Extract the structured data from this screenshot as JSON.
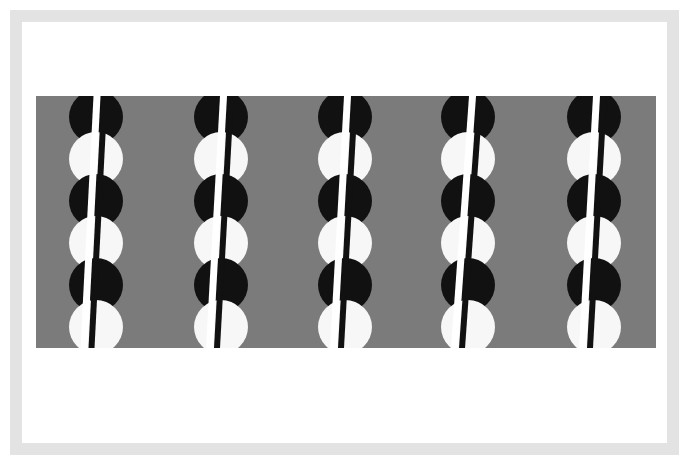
{
  "artwork": {
    "title": "Untitled geometric composition",
    "medium": "flat-color print",
    "canvas": {
      "width": 689,
      "height": 465,
      "background": "#ffffff"
    },
    "frame": {
      "band_color": "#e3e3e3",
      "outer_margin": 10,
      "band_thickness": 12,
      "inner_margin": 22
    },
    "field": {
      "name": "gray-field",
      "color": "#7b7b7b",
      "x": 36,
      "y": 96,
      "width": 620,
      "height": 252
    },
    "discs": {
      "diameter": 54,
      "rows": 6,
      "row_step": 42,
      "row_start_y": 96,
      "colors": [
        "#111111",
        "#f7f7f7"
      ],
      "black_color": "#111111",
      "white_color": "#f7f7f7"
    },
    "columns": [
      {
        "name": "column-1",
        "center_x": 96,
        "rule_top_x": 101,
        "rule_bottom_x": 88
      },
      {
        "name": "column-2",
        "center_x": 221,
        "rule_top_x": 227,
        "rule_bottom_x": 213
      },
      {
        "name": "column-3",
        "center_x": 345,
        "rule_top_x": 351,
        "rule_bottom_x": 337
      },
      {
        "name": "column-4",
        "center_x": 468,
        "rule_top_x": 476,
        "rule_bottom_x": 458
      },
      {
        "name": "column-5",
        "center_x": 594,
        "rule_top_x": 600,
        "rule_bottom_x": 586
      }
    ],
    "rule": {
      "white_width": 7,
      "black_width": 6,
      "white_color": "#ffffff",
      "black_color": "#111111"
    }
  }
}
